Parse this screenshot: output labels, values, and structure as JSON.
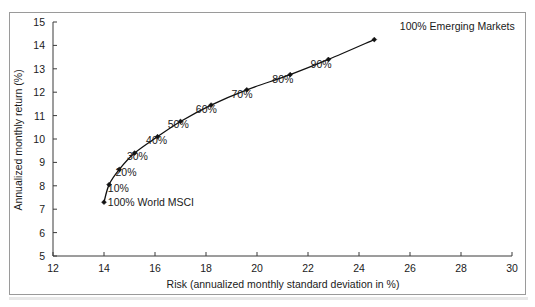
{
  "chart_data": {
    "type": "line",
    "title": "",
    "xlabel": "Risk (annualized monthly standard deviation in %)",
    "ylabel": "Annualized monthly return (%)",
    "xlim": [
      12,
      30
    ],
    "ylim": [
      5,
      15
    ],
    "xticks": [
      12,
      14,
      16,
      18,
      20,
      22,
      24,
      26,
      28,
      30
    ],
    "yticks": [
      5,
      6,
      7,
      8,
      9,
      10,
      11,
      12,
      13,
      14,
      15
    ],
    "xtick_labels": [
      "12",
      "14",
      "16",
      "18",
      "20",
      "22",
      "24",
      "26",
      "28",
      "30"
    ],
    "ytick_labels": [
      "5",
      "6",
      "7",
      "8",
      "9",
      "10",
      "11",
      "12",
      "13",
      "14",
      "15"
    ],
    "grid": false,
    "legend": "none",
    "series": [
      {
        "name": "Efficient frontier: World MSCI to Emerging Markets",
        "points": [
          {
            "label": "100% World MSCI",
            "x": 14.0,
            "y": 7.3
          },
          {
            "label": "10%",
            "x": 14.2,
            "y": 8.05
          },
          {
            "label": "20%",
            "x": 14.6,
            "y": 8.7
          },
          {
            "label": "30%",
            "x": 15.2,
            "y": 9.4
          },
          {
            "label": "40%",
            "x": 16.1,
            "y": 10.1
          },
          {
            "label": "50%",
            "x": 17.0,
            "y": 10.75
          },
          {
            "label": "60%",
            "x": 18.2,
            "y": 11.45
          },
          {
            "label": "70%",
            "x": 19.6,
            "y": 12.1
          },
          {
            "label": "80%",
            "x": 21.3,
            "y": 12.75
          },
          {
            "label": "90%",
            "x": 22.8,
            "y": 13.4
          },
          {
            "label": "100% Emerging Markets",
            "x": 24.6,
            "y": 14.25
          }
        ]
      }
    ],
    "annotations": [
      {
        "text": "100% Emerging Markets",
        "x": 25.6,
        "y": 14.65,
        "anchor": "start"
      },
      {
        "text": "90%",
        "x": 22.1,
        "y": 13.05,
        "anchor": "start"
      },
      {
        "text": "80%",
        "x": 20.6,
        "y": 12.4,
        "anchor": "start"
      },
      {
        "text": "70%",
        "x": 19.0,
        "y": 11.75,
        "anchor": "start"
      },
      {
        "text": "60%",
        "x": 17.6,
        "y": 11.1,
        "anchor": "start"
      },
      {
        "text": "50%",
        "x": 16.5,
        "y": 10.45,
        "anchor": "start"
      },
      {
        "text": "40%",
        "x": 15.65,
        "y": 9.8,
        "anchor": "start"
      },
      {
        "text": "30%",
        "x": 14.9,
        "y": 9.1,
        "anchor": "start"
      },
      {
        "text": "20%",
        "x": 14.45,
        "y": 8.4,
        "anchor": "start"
      },
      {
        "text": "10%",
        "x": 14.15,
        "y": 7.75,
        "anchor": "start"
      },
      {
        "text": "100% World MSCI",
        "x": 14.15,
        "y": 7.15,
        "anchor": "start"
      }
    ],
    "colors": {
      "line": "#111111",
      "marker": "#111111",
      "axis": "#3a3a3a",
      "frame": "#9a9a9a",
      "background": "#ffffff",
      "text": "#1a1a1a"
    }
  }
}
